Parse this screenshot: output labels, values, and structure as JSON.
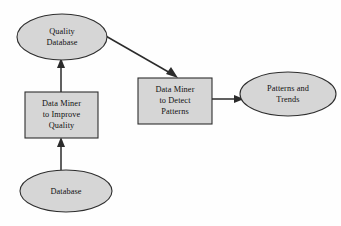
{
  "diagram": {
    "type": "flowchart",
    "background_color": "#fefefe",
    "node_fill_color": "#d6d6d6",
    "node_stroke_color": "#2e2e2e",
    "edge_color": "#2b2b2b",
    "nodes": [
      {
        "id": "quality-database",
        "shape": "ellipse",
        "lines": [
          "Quality",
          "Database"
        ],
        "cx": 62,
        "cy": 37,
        "rx": 45,
        "ry": 23
      },
      {
        "id": "data-miner-improve-quality",
        "shape": "rectangle",
        "lines": [
          "Data Miner",
          "to Improve",
          "Quality"
        ],
        "x": 25,
        "y": 92,
        "width": 73,
        "height": 46
      },
      {
        "id": "database",
        "shape": "ellipse",
        "lines": [
          "Database"
        ],
        "cx": 66,
        "cy": 191,
        "rx": 46,
        "ry": 21
      },
      {
        "id": "data-miner-detect-patterns",
        "shape": "rectangle",
        "lines": [
          "Data Miner",
          "to Detect",
          "Patterns"
        ],
        "x": 138,
        "y": 78,
        "width": 74,
        "height": 46
      },
      {
        "id": "patterns-and-trends",
        "shape": "ellipse",
        "lines": [
          "Patterns and",
          "Trends"
        ],
        "cx": 288,
        "cy": 94,
        "rx": 48,
        "ry": 22
      }
    ],
    "edges": [
      {
        "id": "edge-database-to-improve-quality",
        "from": "database",
        "to": "data-miner-improve-quality",
        "direction": "up",
        "x1": 61,
        "y1": 170,
        "x2": 61,
        "y2": 139
      },
      {
        "id": "edge-improve-quality-to-quality-database",
        "from": "data-miner-improve-quality",
        "to": "quality-database",
        "direction": "up",
        "x1": 61,
        "y1": 92,
        "x2": 61,
        "y2": 60
      },
      {
        "id": "edge-quality-database-to-detect-patterns",
        "from": "quality-database",
        "to": "data-miner-detect-patterns",
        "direction": "diagonal-down-right",
        "x1": 104,
        "y1": 35,
        "x2": 176,
        "y2": 77
      },
      {
        "id": "edge-detect-patterns-to-patterns-trends",
        "from": "data-miner-detect-patterns",
        "to": "patterns-and-trends",
        "direction": "right",
        "x1": 212,
        "y1": 99,
        "x2": 242,
        "y2": 99
      }
    ]
  }
}
